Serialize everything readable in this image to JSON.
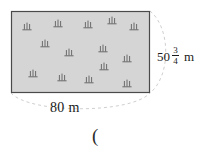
{
  "figure": {
    "name": "rectangular-plot-diagram",
    "shape": "rectangle",
    "fill_color": "#d5d5d5",
    "border_color": "#4a4a4a",
    "arc_color": "#c9c9c9",
    "rect": {
      "x": 11,
      "y": 11,
      "width": 139,
      "height": 82
    }
  },
  "labels": {
    "width": "80 m",
    "width_value": "80",
    "width_unit": "m",
    "height_whole": "50",
    "height_numerator": "3",
    "height_denominator": "4",
    "height_unit": "m",
    "height_full": "50 3/4 m",
    "stray_paren": "("
  },
  "trees": {
    "icon_name": "tree-icon",
    "count": 14,
    "color": "#5f5f5f",
    "positions": [
      {
        "x": 27,
        "y": 29
      },
      {
        "x": 58,
        "y": 26
      },
      {
        "x": 88,
        "y": 27
      },
      {
        "x": 112,
        "y": 23
      },
      {
        "x": 134,
        "y": 29
      },
      {
        "x": 45,
        "y": 46
      },
      {
        "x": 69,
        "y": 55
      },
      {
        "x": 103,
        "y": 51
      },
      {
        "x": 127,
        "y": 61
      },
      {
        "x": 33,
        "y": 76
      },
      {
        "x": 62,
        "y": 80
      },
      {
        "x": 89,
        "y": 82
      },
      {
        "x": 127,
        "y": 86
      },
      {
        "x": 104,
        "y": 69
      }
    ]
  }
}
